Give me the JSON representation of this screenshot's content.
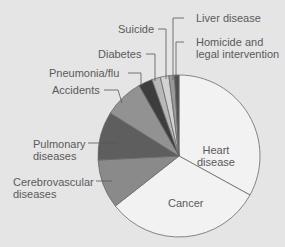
{
  "chart_data": {
    "type": "pie",
    "title": "",
    "start_angle_deg": 0,
    "direction": "clockwise",
    "slices": [
      {
        "label": "Heart disease",
        "value": 33.0,
        "color": "#f2f2f2"
      },
      {
        "label": "Cancer",
        "value": 31.4,
        "color": "#f2f2f2"
      },
      {
        "label": "Cerebrovascular diseases",
        "value": 9.8,
        "color": "#8a8a8a"
      },
      {
        "label": "Pulmonary diseases",
        "value": 9.7,
        "color": "#5e5e5e"
      },
      {
        "label": "Accidents",
        "value": 7.9,
        "color": "#929292"
      },
      {
        "label": "Pneumonia/flu",
        "value": 2.8,
        "color": "#3d3d3d"
      },
      {
        "label": "Diabetes",
        "value": 1.7,
        "color": "#b8b8b8"
      },
      {
        "label": "Suicide",
        "value": 1.7,
        "color": "#d2d2d2"
      },
      {
        "label": "Liver disease",
        "value": 1.1,
        "color": "#9a9a9a"
      },
      {
        "label": "Homicide and legal intervention",
        "value": 0.9,
        "color": "#4e4e4e"
      }
    ],
    "legend": "none (direct labels with leader lines)"
  },
  "labels": {
    "heart": [
      "Heart",
      "disease"
    ],
    "cancer": [
      "Cancer"
    ],
    "cerebro": [
      "Cerebrovascular",
      "diseases"
    ],
    "pulmonary": [
      "Pulmonary",
      "diseases"
    ],
    "accidents": [
      "Accidents"
    ],
    "pneumonia": [
      "Pneumonia/flu"
    ],
    "diabetes": [
      "Diabetes"
    ],
    "suicide": [
      "Suicide"
    ],
    "liver": [
      "Liver disease"
    ],
    "homicide": [
      "Homicide and",
      "legal intervention"
    ]
  },
  "style": {
    "background": "#e5e5e5",
    "outline": "#6a6a6a",
    "label_color": "#5a5a5a"
  }
}
